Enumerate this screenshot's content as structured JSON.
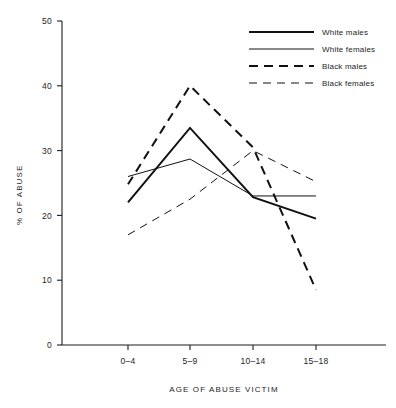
{
  "chart_data": {
    "type": "line",
    "title": "",
    "xlabel": "AGE OF ABUSE VICTIM",
    "ylabel": "% OF ABUSE",
    "categories": [
      "0–4",
      "5–9",
      "10–14",
      "15–18"
    ],
    "ylim": [
      0,
      50
    ],
    "yticks": [
      0,
      10,
      20,
      30,
      40,
      50
    ],
    "ytick_labels": [
      "0",
      "10",
      "20",
      "30",
      "40",
      "50"
    ],
    "grid": false,
    "legend_position": "top-right",
    "series": [
      {
        "name": "White males",
        "values": [
          22.0,
          33.5,
          22.8,
          19.5
        ],
        "style": "solid",
        "width": 2.0,
        "color": "#111111"
      },
      {
        "name": "White females",
        "values": [
          26.0,
          28.7,
          23.0,
          23.0
        ],
        "style": "solid",
        "width": 1.0,
        "color": "#111111"
      },
      {
        "name": "Black males",
        "values": [
          24.8,
          40.0,
          30.5,
          8.5
        ],
        "style": "dashed",
        "width": 2.0,
        "color": "#111111"
      },
      {
        "name": "Black females",
        "values": [
          17.0,
          22.5,
          30.0,
          25.2
        ],
        "style": "dashed",
        "width": 1.0,
        "color": "#111111"
      }
    ]
  },
  "legend": {
    "entries": [
      {
        "label": "White males"
      },
      {
        "label": "White females"
      },
      {
        "label": "Black males"
      },
      {
        "label": "Black females"
      }
    ]
  },
  "top_partial_text": ""
}
